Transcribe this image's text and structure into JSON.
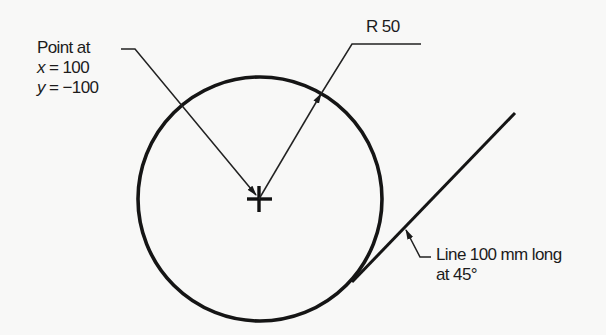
{
  "diagram": {
    "type": "technical-drawing",
    "background": "#f8f8f7",
    "stroke_color": "#1a1a1a",
    "circle": {
      "center": [
        260,
        199
      ],
      "radius": 122,
      "radius_label": "R 50"
    },
    "center_mark": {
      "symbol": "cross",
      "position": [
        260,
        199
      ]
    },
    "tangent_line": {
      "start": [
        352,
        282
      ],
      "end": [
        515,
        113
      ]
    },
    "annotations": {
      "point": {
        "line1": "Point at",
        "x_var": "x",
        "x_eq": " = 100",
        "y_var": "y",
        "y_eq": " = −100"
      },
      "radius": {
        "text": "R 50"
      },
      "line": {
        "line1": "Line 100 mm long",
        "line2": "at 45°"
      }
    }
  }
}
